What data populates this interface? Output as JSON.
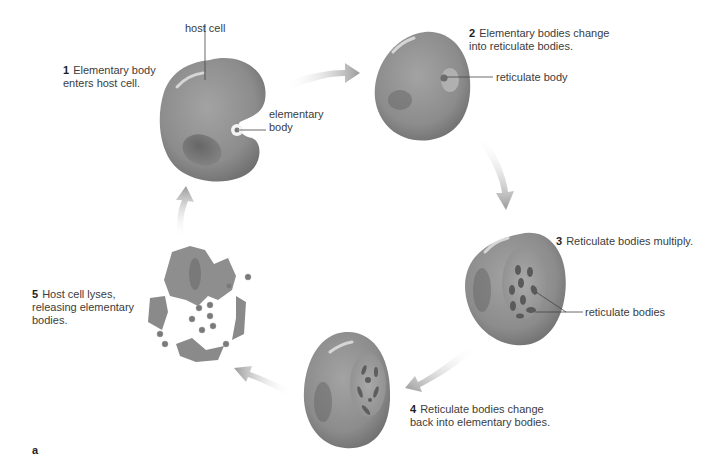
{
  "figure": {
    "panel_letter": "a"
  },
  "steps": [
    {
      "number": "1",
      "line1": "Elementary body",
      "line2": "enters host cell."
    },
    {
      "number": "2",
      "line1": "Elementary bodies change",
      "line2": "into reticulate bodies."
    },
    {
      "number": "3",
      "line1": "Reticulate bodies multiply.",
      "line2": ""
    },
    {
      "number": "4",
      "line1": "Reticulate bodies change",
      "line2": "back into elementary bodies."
    },
    {
      "number": "5",
      "line1": "Host cell lyses,",
      "line2": "releasing elementary",
      "line3": "bodies."
    }
  ],
  "callouts": {
    "host_cell": "host cell",
    "elementary_body_line1": "elementary",
    "elementary_body_line2": "body",
    "reticulate_body": "reticulate body",
    "reticulate_bodies": "reticulate bodies"
  },
  "colors": {
    "cell": "#8f8f8f",
    "cell_dark": "#6e6e6e",
    "nucleus": "#6a6a6a",
    "arrow": "#a8a8a8",
    "text": "#3c3c3c"
  }
}
